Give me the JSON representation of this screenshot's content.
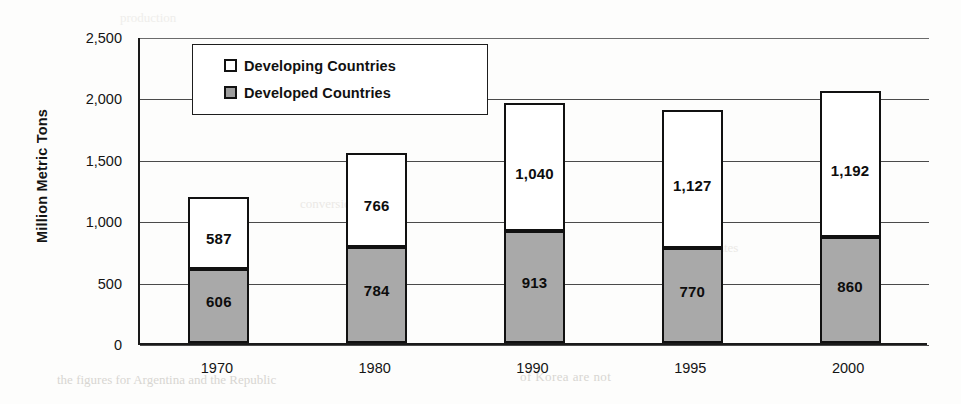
{
  "chart_data": {
    "type": "bar",
    "subtype": "stacked-vertical",
    "title": "",
    "xlabel": "",
    "ylabel": "Million Metric Tons",
    "categories": [
      "1970",
      "1980",
      "1990",
      "1995",
      "2000"
    ],
    "series": [
      {
        "name": "Developed Countries",
        "color": "#a9a9a9",
        "stack_position": "bottom",
        "values": [
          606,
          784,
          913,
          770,
          860
        ],
        "labels": [
          "606",
          "784",
          "913",
          "770",
          "860"
        ]
      },
      {
        "name": "Developing Countries",
        "color": "#ffffff",
        "stack_position": "top",
        "values": [
          587,
          766,
          1040,
          1127,
          1192
        ],
        "labels": [
          "587",
          "766",
          "1,040",
          "1,127",
          "1,192"
        ]
      }
    ],
    "totals": [
      1193,
      1550,
      1953,
      1897,
      2052
    ],
    "ylim": [
      0,
      2500
    ],
    "ytick_values": [
      0,
      500,
      1000,
      1500,
      2000,
      2500
    ],
    "ytick_labels": [
      "0",
      "500",
      "1,000",
      "1,500",
      "2,000",
      "2,500"
    ],
    "grid": true,
    "grid_axis": "y",
    "legend_position": "top-left-inside",
    "legend_entries": [
      "Developing Countries",
      "Developed Countries"
    ]
  },
  "legend": {
    "items": [
      {
        "label": "Developing Countries",
        "swatch": "white"
      },
      {
        "label": "Developed Countries",
        "swatch": "gray"
      }
    ]
  },
  "axes": {
    "y_title": "Million Metric Tons",
    "y_ticks": [
      "2,500",
      "2,000",
      "1,500",
      "1,000",
      "500",
      "0"
    ],
    "x_ticks": [
      "1970",
      "1980",
      "1990",
      "1995",
      "2000"
    ]
  },
  "artifacts": {
    "bleed_1": "the figures for Argentina and the Republic",
    "bleed_2": "of Korea are not",
    "bleed_3": "conversion rates",
    "bleed_4": "estimates",
    "bleed_5": "production"
  }
}
